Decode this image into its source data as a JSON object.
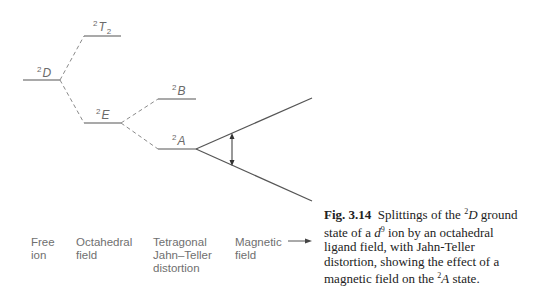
{
  "diagram": {
    "levels": {
      "free_ion": {
        "term": "D",
        "multiplicity": "2"
      },
      "oct_upper": {
        "term": "T",
        "multiplicity": "2",
        "subscript": "2"
      },
      "oct_lower": {
        "term": "E",
        "multiplicity": "2"
      },
      "tet_upper": {
        "term": "B",
        "multiplicity": "2"
      },
      "tet_lower": {
        "term": "A",
        "multiplicity": "2"
      }
    },
    "stages": [
      {
        "label": "Free\nion"
      },
      {
        "label": "Octahedral\nfield"
      },
      {
        "label": "Tetragonal\nJahn–Teller\ndistortion"
      },
      {
        "label": "Magnetic\nfield"
      }
    ],
    "colors": {
      "level_line": "#555555",
      "dashed_line": "#8a8a8a",
      "text": "#6a6a6a",
      "caption": "#222222"
    }
  },
  "caption": {
    "fig_label": "Fig. 3.14",
    "text_1": "Splittings of the ",
    "sup_1": "2",
    "term_1": "D",
    "text_2": " ground state of a ",
    "ion": "d",
    "ion_sup": "9",
    "text_3": " ion by an octahedral ligand field, with Jahn-Teller distortion, showing the effect of a magnetic field on the ",
    "sup_2": "2",
    "term_2": "A",
    "text_4": " state."
  }
}
